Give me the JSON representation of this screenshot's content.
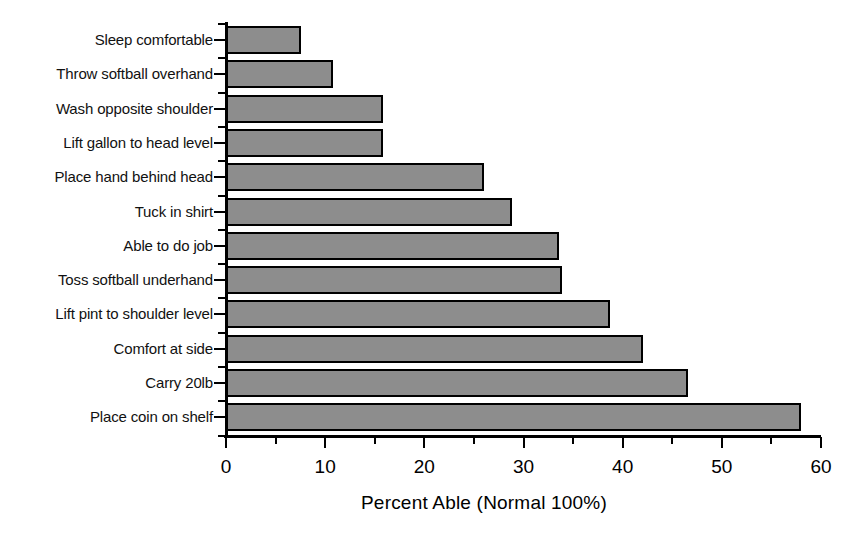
{
  "chart_data": {
    "type": "bar",
    "orientation": "horizontal",
    "title": "",
    "xlabel": "Percent Able (Normal 100%)",
    "ylabel": "",
    "categories": [
      "Sleep comfortable",
      "Throw softball overhand",
      "Wash opposite shoulder",
      "Lift gallon to head level",
      "Place hand behind head",
      "Tuck in shirt",
      "Able to do job",
      "Toss softball underhand",
      "Lift pint to shoulder level",
      "Comfort at side",
      "Carry 20lb",
      "Place coin on shelf"
    ],
    "values": [
      7.6,
      10.8,
      15.8,
      15.8,
      26.0,
      28.8,
      33.6,
      33.9,
      38.7,
      42.0,
      46.6,
      58.0
    ],
    "xlim": [
      0,
      60
    ],
    "xticks": [
      0,
      10,
      20,
      30,
      40,
      50,
      60
    ],
    "xtick_labels": [
      "0",
      "10",
      "20",
      "30",
      "40",
      "50",
      "60"
    ],
    "xminor_ticks": [
      5,
      15,
      25,
      35,
      45,
      55
    ],
    "grid": false,
    "legend": null,
    "bar_fill_color": "#8d8d8d",
    "bar_border_color": "#000000",
    "axis_color": "#000000",
    "background_color": "#ffffff"
  }
}
